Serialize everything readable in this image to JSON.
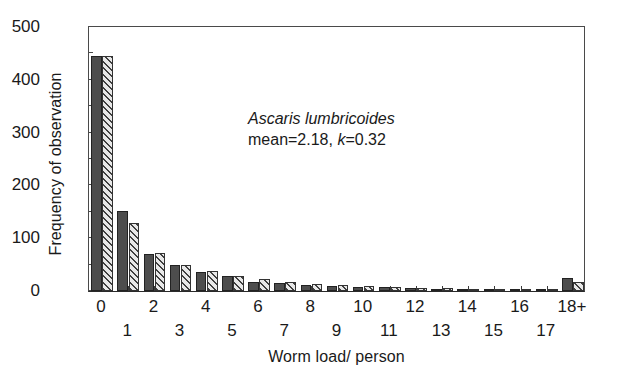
{
  "chart_data": {
    "type": "bar",
    "title": "",
    "xlabel": "Worm load/ person",
    "ylabel": "Frequency of observation",
    "ylim": [
      0,
      500
    ],
    "ytick_major": [
      0,
      100,
      200,
      300,
      400,
      500
    ],
    "ytick_minor": [
      50,
      150,
      250,
      350,
      450
    ],
    "grid": false,
    "legend": "none",
    "categories": [
      "0",
      "1",
      "2",
      "3",
      "4",
      "5",
      "6",
      "7",
      "8",
      "9",
      "10",
      "11",
      "12",
      "13",
      "14",
      "15",
      "16",
      "17",
      "18+"
    ],
    "series": [
      {
        "name": "observed",
        "style": "solid-dark",
        "values": [
          445,
          152,
          71,
          50,
          36,
          28,
          18,
          15,
          12,
          9,
          8,
          7,
          5,
          4,
          3,
          2,
          2,
          4,
          25
        ]
      },
      {
        "name": "fitted-negative-binomial",
        "style": "diagonal-hatch",
        "values": [
          446,
          128,
          72,
          50,
          37,
          29,
          22,
          17,
          14,
          11,
          9,
          7,
          6,
          5,
          4,
          3,
          2,
          2,
          18
        ]
      }
    ],
    "annotation": {
      "species": "Ascaris lumbricoides",
      "stats_prefix": "mean=2.18, ",
      "k_symbol": "k",
      "k_value": "=0.32"
    }
  },
  "axes": {
    "y_title": "Frequency of observation",
    "x_title": "Worm load/ person"
  },
  "colors": {
    "solid_bar": "#4d4d4d",
    "hatch_fill": "#e8e8e8",
    "hatch_line": "#404040",
    "axis": "#3a3a3a",
    "text": "#1a1a1a"
  }
}
